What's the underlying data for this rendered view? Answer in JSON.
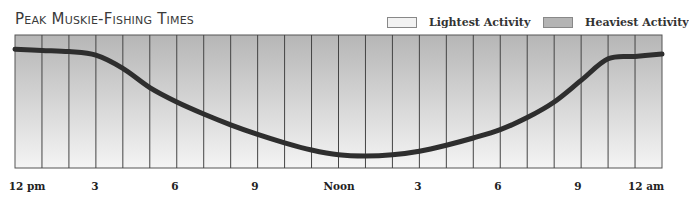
{
  "chart_data": {
    "type": "line",
    "title": "Peak Muskie-Fishing Times",
    "xlabel": "",
    "ylabel": "",
    "legend": [
      {
        "label": "Lightest Activity",
        "color": "#f2f2f2"
      },
      {
        "label": "Heaviest Activity",
        "color": "#b4b4b4"
      }
    ],
    "legend_position": "top-right",
    "background_gradient": "vertical, heaviest (dark gray) at top to lightest (near white) at bottom",
    "grid": {
      "vertical_lines": 24,
      "horizontal_lines": false
    },
    "tick_labels": [
      "12 pm",
      "3",
      "6",
      "9",
      "Noon",
      "3",
      "6",
      "9",
      "12 am"
    ],
    "x_hours": [
      0,
      3,
      6,
      9,
      12,
      15,
      18,
      21,
      24
    ],
    "series": [
      {
        "name": "Activity level",
        "color": "#333333",
        "x": [
          0,
          1,
          2,
          3,
          4,
          5,
          6,
          7,
          8,
          9,
          10,
          11,
          12,
          13,
          14,
          15,
          16,
          17,
          18,
          19,
          20,
          21,
          22,
          23,
          24
        ],
        "values": [
          0.94,
          0.93,
          0.92,
          0.89,
          0.78,
          0.62,
          0.5,
          0.4,
          0.31,
          0.23,
          0.16,
          0.1,
          0.06,
          0.05,
          0.06,
          0.09,
          0.14,
          0.2,
          0.27,
          0.37,
          0.5,
          0.68,
          0.86,
          0.88,
          0.9
        ]
      }
    ],
    "ylim": [
      0,
      1
    ]
  },
  "legend": {
    "light_label": "Lightest Activity",
    "heavy_label": "Heaviest Activity"
  },
  "title": "Peak Muskie-Fishing Times",
  "x_axis": {
    "labels": [
      "12 pm",
      "3",
      "6",
      "9",
      "Noon",
      "3",
      "6",
      "9",
      "12 am"
    ]
  }
}
